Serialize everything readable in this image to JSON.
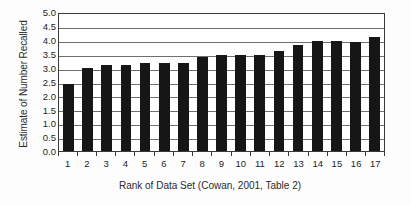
{
  "chart_data": {
    "type": "bar",
    "title": "",
    "xlabel": "Rank of Data Set (Cowan, 2001, Table 2)",
    "ylabel": "Estimate of Number Recalled",
    "categories": [
      "1",
      "2",
      "3",
      "4",
      "5",
      "6",
      "7",
      "8",
      "9",
      "10",
      "11",
      "12",
      "13",
      "14",
      "15",
      "16",
      "17"
    ],
    "values": [
      2.4,
      3.0,
      3.08,
      3.08,
      3.18,
      3.18,
      3.18,
      3.38,
      3.47,
      3.47,
      3.45,
      3.58,
      3.83,
      3.95,
      3.95,
      3.93,
      4.1
    ],
    "ylim": [
      0.0,
      5.0
    ],
    "yticks": [
      "0.0",
      "0.5",
      "1.0",
      "1.5",
      "2.0",
      "2.5",
      "3.0",
      "3.5",
      "4.0",
      "4.5",
      "5.0"
    ],
    "ytick_values": [
      0.0,
      0.5,
      1.0,
      1.5,
      2.0,
      2.5,
      3.0,
      3.5,
      4.0,
      4.5,
      5.0
    ],
    "grid": true,
    "grid_axis": "y",
    "legend": "none",
    "bar_color": "#161616",
    "grid_color": "#6f6f6f",
    "axis_color": "#3a3a3a",
    "background_color": "#ffffff"
  }
}
